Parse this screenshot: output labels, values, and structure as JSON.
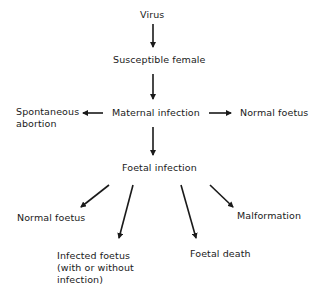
{
  "diagram": {
    "nodes": {
      "virus": "Virus",
      "susceptible_female": "Susceptible female",
      "maternal_infection": "Maternal infection",
      "spontaneous_abortion_1": "Spontaneous",
      "spontaneous_abortion_2": "abortion",
      "normal_foetus_maternal": "Normal foetus",
      "foetal_infection": "Foetal infection",
      "normal_foetus_foetal": "Normal foetus",
      "malformation": "Malformation",
      "infected_foetus_1": "Infected foetus",
      "infected_foetus_2": "(with or without",
      "infected_foetus_3": "infection)",
      "foetal_death": "Foetal death"
    },
    "edges": [
      {
        "from": "Virus",
        "to": "Susceptible female"
      },
      {
        "from": "Susceptible female",
        "to": "Maternal infection"
      },
      {
        "from": "Maternal infection",
        "to": "Spontaneous abortion"
      },
      {
        "from": "Maternal infection",
        "to": "Normal foetus"
      },
      {
        "from": "Maternal infection",
        "to": "Foetal infection"
      },
      {
        "from": "Foetal infection",
        "to": "Normal foetus"
      },
      {
        "from": "Foetal infection",
        "to": "Infected foetus (with or without infection)"
      },
      {
        "from": "Foetal infection",
        "to": "Foetal death"
      },
      {
        "from": "Foetal infection",
        "to": "Malformation"
      }
    ],
    "colors": {
      "ink": "#1a1a1a",
      "background": "#ffffff"
    }
  }
}
